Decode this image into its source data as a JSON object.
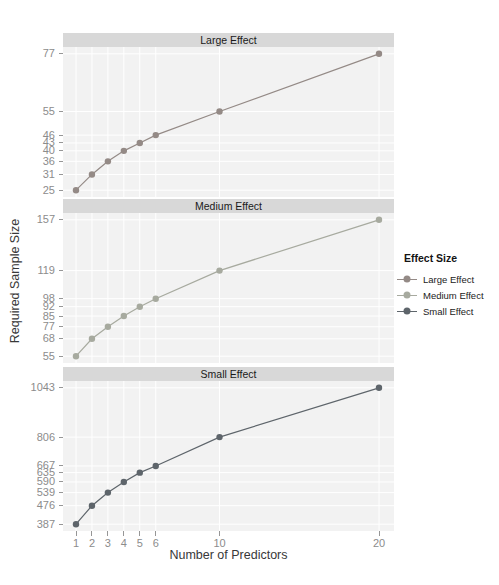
{
  "figure": {
    "x_axis_title": "Number of Predictors",
    "y_axis_title": "Required Sample Size"
  },
  "legend": {
    "title": "Effect Size",
    "items": [
      {
        "label": "Large Effect",
        "color": "#948a86"
      },
      {
        "label": "Medium Effect",
        "color": "#a7aa9f"
      },
      {
        "label": "Small Effect",
        "color": "#5e656b"
      }
    ]
  },
  "colors": {
    "panel_background": "#f2f2f2",
    "strip_background": "#d8d8d8",
    "gridline": "#ffffff",
    "tick_text": "#8c8c8c",
    "axis_title_text": "#383838"
  },
  "chart_data": {
    "type": "line",
    "title": "",
    "xlabel": "Number of Predictors",
    "ylabel": "Required Sample Size",
    "x": [
      1,
      2,
      3,
      4,
      5,
      6,
      10,
      20
    ],
    "x_tick_labels": [
      "1",
      "2",
      "3",
      "4",
      "5",
      "6",
      "10",
      "20"
    ],
    "grid": true,
    "legend_position": "right",
    "facets": [
      {
        "label": "Large Effect",
        "color": "#948a86",
        "values": [
          25,
          31,
          36,
          40,
          43,
          46,
          55,
          77
        ],
        "y_ticks": [
          25,
          31,
          36,
          40,
          43,
          46,
          55,
          77
        ]
      },
      {
        "label": "Medium Effect",
        "color": "#a7aa9f",
        "values": [
          55,
          68,
          77,
          85,
          92,
          98,
          119,
          157
        ],
        "y_ticks": [
          55,
          68,
          77,
          85,
          92,
          98,
          119,
          157
        ]
      },
      {
        "label": "Small Effect",
        "color": "#5e656b",
        "values": [
          387,
          476,
          539,
          590,
          635,
          667,
          806,
          1043
        ],
        "y_ticks": [
          387,
          476,
          539,
          590,
          635,
          667,
          806,
          1043
        ]
      }
    ]
  }
}
